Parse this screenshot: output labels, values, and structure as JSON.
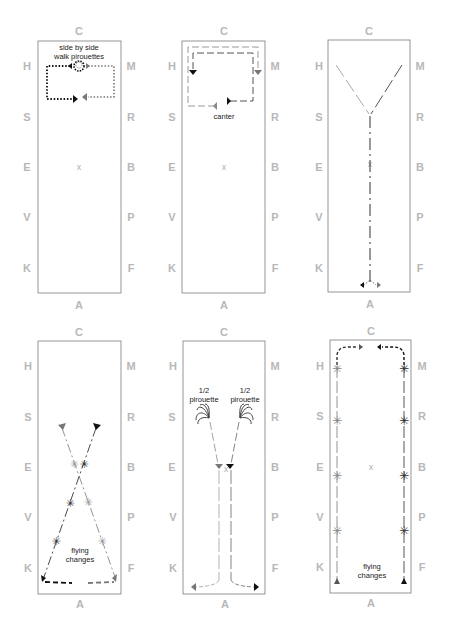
{
  "diagrams": [
    {
      "id": 1,
      "letters": {
        "top": "C",
        "bottom": "A",
        "left": [
          "H",
          "S",
          "E",
          "V",
          "K"
        ],
        "right": [
          "M",
          "R",
          "B",
          "P",
          "F"
        ]
      },
      "center_mark": "x",
      "labels": [
        "side by side",
        "walk pirouettes"
      ],
      "figure": "side-by-side walk pirouettes, dotted rectangle path"
    },
    {
      "id": 2,
      "letters": {
        "top": "C",
        "bottom": "A",
        "left": [
          "H",
          "S",
          "E",
          "V",
          "K"
        ],
        "right": [
          "M",
          "R",
          "B",
          "P",
          "F"
        ]
      },
      "center_mark": "x",
      "labels": [
        "canter"
      ],
      "figure": "canter dashed loops at C end"
    },
    {
      "id": 3,
      "letters": {
        "top": "C",
        "bottom": "A",
        "left": [
          "H",
          "S",
          "E",
          "V",
          "K"
        ],
        "right": [
          "M",
          "R",
          "B",
          "P",
          "F"
        ]
      },
      "center_mark": "x",
      "labels": [],
      "figure": "Y-shaped path from H and M down centre line to A, split at A"
    },
    {
      "id": 4,
      "letters": {
        "top": "C",
        "bottom": "A",
        "left": [
          "H",
          "S",
          "E",
          "V",
          "K"
        ],
        "right": [
          "M",
          "R",
          "B",
          "P",
          "F"
        ]
      },
      "center_mark": "",
      "labels": [
        "flying",
        "changes"
      ],
      "figure": "crossing diagonals with flying changes"
    },
    {
      "id": 5,
      "letters": {
        "top": "C",
        "bottom": "A",
        "left": [
          "H",
          "S",
          "E",
          "V",
          "K"
        ],
        "right": [
          "M",
          "R",
          "B",
          "P",
          "F"
        ]
      },
      "center_mark": "x",
      "labels_left": [
        "1/2",
        "pirouette"
      ],
      "labels_right": [
        "1/2",
        "pirouette"
      ],
      "figure": "half pirouettes then parallel lines to A, splitting"
    },
    {
      "id": 6,
      "letters": {
        "top": "C",
        "bottom": "A",
        "left": [
          "H",
          "S",
          "E",
          "V",
          "K"
        ],
        "right": [
          "M",
          "R",
          "B",
          "P",
          "F"
        ]
      },
      "center_mark": "x",
      "labels": [
        "flying",
        "changes"
      ],
      "figure": "long side lines with flying changes, turns at C"
    }
  ]
}
